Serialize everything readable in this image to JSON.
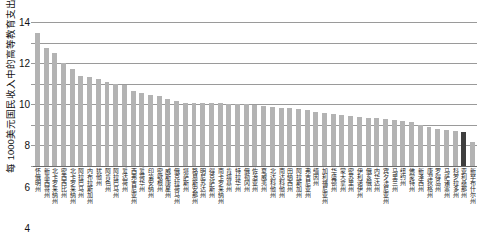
{
  "chart_data": {
    "type": "bar",
    "title": "",
    "xlabel": "",
    "ylabel": "每 1000美元国民收入中的高等教育支出/美元",
    "ylim": [
      0,
      14
    ],
    "yticks": [
      0,
      2,
      4,
      6,
      8,
      10,
      12,
      14
    ],
    "grid": true,
    "legend": null,
    "bar_color": "#b3b3b3",
    "highlight_color": "#3f3f3f",
    "highlight_index": 49,
    "categories": [
      "怀俄明州",
      "新墨西哥州",
      "北卡罗来纳州",
      "密西西比州",
      "北卡罗来纳州",
      "阿拉巴马州",
      "内布拉斯加州",
      "犹他州",
      "阿肯色州",
      "阿拉巴马州",
      "爱达荷州",
      "西弗吉尼亚州",
      "爱荷华州",
      "印第安纳州",
      "密歇根州",
      "威斯康星州",
      "俄克拉荷马州",
      "堪萨斯州",
      "路易斯安那州",
      "明尼苏达州",
      "得克萨斯州",
      "南卡罗来纳州",
      "肯塔基州",
      "特拉华州",
      "俄勒冈州",
      "佐治亚州",
      "夏威夷州",
      "北达科他州",
      "南达科他州",
      "田纳西州",
      "阿拉斯加州",
      "弗吉尼亚州",
      "缅因州",
      "加利福尼亚州",
      "华盛顿州",
      "蒙大拿州",
      "密苏里州",
      "伊利诺伊州",
      "俄亥俄州",
      "内华达州",
      "宾夕法尼亚州",
      "马里兰州",
      "纽约州",
      "佛蒙特州",
      "新泽西州",
      "康涅狄格州",
      "罗得岛州",
      "马萨诸塞州",
      "科罗拉多州",
      "亚利桑那州",
      "新罕布什尔州"
    ],
    "values": [
      12.9,
      11.5,
      11.0,
      10.0,
      9.4,
      8.8,
      8.7,
      8.5,
      8.2,
      8.0,
      7.9,
      7.3,
      7.1,
      6.9,
      6.8,
      6.5,
      6.3,
      6.1,
      6.1,
      6.1,
      6.1,
      6.1,
      6.0,
      6.0,
      6.0,
      5.9,
      5.8,
      5.7,
      5.6,
      5.6,
      5.5,
      5.4,
      5.3,
      5.2,
      5.1,
      5.0,
      4.9,
      4.8,
      4.7,
      4.7,
      4.6,
      4.5,
      4.4,
      4.3,
      4.0,
      3.8,
      3.6,
      3.5,
      3.4,
      3.3,
      2.3
    ]
  }
}
